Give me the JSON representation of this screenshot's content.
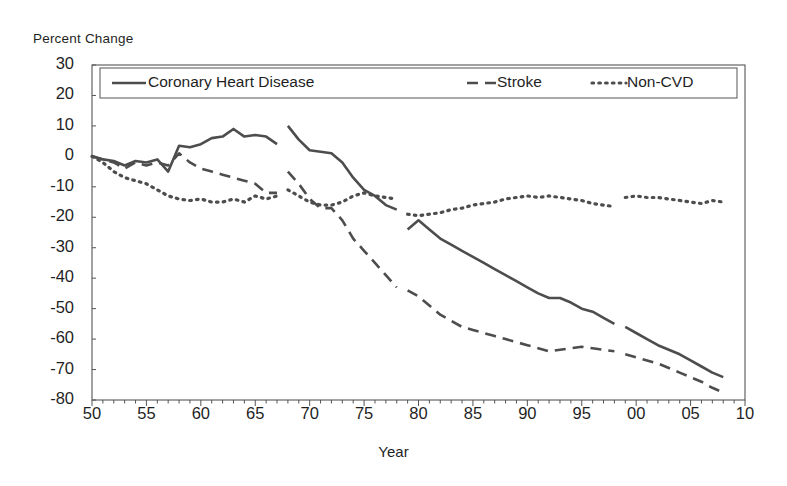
{
  "chart_data": {
    "type": "line",
    "title": "",
    "xlabel": "Year",
    "ylabel": "Percent Change",
    "ylim": [
      -80,
      30
    ],
    "xlim": [
      1950,
      2010
    ],
    "ytick_values": [
      30,
      20,
      10,
      0,
      -10,
      -20,
      -30,
      -40,
      -50,
      -60,
      -70,
      -80
    ],
    "ytick_labels": [
      "30",
      "20",
      "10",
      "0",
      "-10",
      "-20",
      "-30",
      "-40",
      "-50",
      "-60",
      "-70",
      "-80"
    ],
    "xtick_values": [
      1950,
      1955,
      1960,
      1965,
      1970,
      1975,
      1980,
      1985,
      1990,
      1995,
      2000,
      2005,
      2010
    ],
    "xtick_labels": [
      "50",
      "55",
      "60",
      "65",
      "70",
      "75",
      "80",
      "85",
      "90",
      "95",
      "00",
      "05",
      "10"
    ],
    "grid": false,
    "minor_ticks": "annual",
    "legend_position": "top-inside",
    "axis_color": "#555555",
    "series": [
      {
        "name": "Coronary Heart Disease",
        "style": "solid",
        "color": "#4d4d4d",
        "segments": [
          {
            "x": [
              1950,
              1951,
              1952,
              1953,
              1954,
              1955,
              1956,
              1957,
              1958,
              1959,
              1960,
              1961,
              1962,
              1963,
              1964,
              1965,
              1966,
              1967
            ],
            "y": [
              0,
              -1,
              -1.5,
              -3,
              -1.5,
              -2,
              -1,
              -5,
              3.5,
              3,
              4,
              6,
              6.5,
              9,
              6.5,
              7,
              6.5,
              4
            ]
          },
          {
            "x": [
              1968,
              1969,
              1970,
              1971,
              1972,
              1973,
              1974,
              1975,
              1976,
              1977,
              1978
            ],
            "y": [
              10,
              5.5,
              2,
              1.5,
              1,
              -2,
              -7,
              -11,
              -13,
              -16,
              -17.5
            ]
          },
          {
            "x": [
              1979,
              1980,
              1981,
              1982,
              1983,
              1984,
              1985,
              1986,
              1987,
              1988,
              1989,
              1990,
              1991,
              1992,
              1993,
              1994,
              1995,
              1996,
              1997,
              1998
            ],
            "y": [
              -24,
              -21,
              -24,
              -27,
              -29,
              -31,
              -33,
              -35,
              -37,
              -39,
              -41,
              -43,
              -45,
              -46.5,
              -46.5,
              -48,
              -50,
              -51,
              -53,
              -55
            ]
          },
          {
            "x": [
              1999,
              2000,
              2001,
              2002,
              2003,
              2004,
              2005,
              2006,
              2007,
              2008
            ],
            "y": [
              -56,
              -58,
              -60,
              -62,
              -63.5,
              -65,
              -67,
              -69,
              -71,
              -72.5
            ]
          }
        ]
      },
      {
        "name": "Stroke",
        "style": "dashed",
        "color": "#4d4d4d",
        "segments": [
          {
            "x": [
              1950,
              1951,
              1952,
              1953,
              1954,
              1955,
              1956,
              1957,
              1958,
              1959,
              1960,
              1961,
              1962,
              1963,
              1964,
              1965,
              1966,
              1967
            ],
            "y": [
              0,
              -1,
              -2,
              -4,
              -2,
              -3,
              -2,
              -3,
              1,
              -2,
              -4,
              -5,
              -6,
              -7,
              -8,
              -9,
              -12,
              -12
            ]
          },
          {
            "x": [
              1968,
              1969,
              1970,
              1971,
              1972,
              1973,
              1974,
              1975,
              1976,
              1977,
              1978
            ],
            "y": [
              -5,
              -9,
              -14,
              -17,
              -17,
              -21,
              -27,
              -31,
              -35,
              -39,
              -43
            ]
          },
          {
            "x": [
              1979,
              1980,
              1981,
              1982,
              1983,
              1984,
              1985,
              1986,
              1987,
              1988,
              1989,
              1990,
              1991,
              1992,
              1993,
              1994,
              1995,
              1996,
              1997,
              1998
            ],
            "y": [
              -44,
              -46,
              -49,
              -52,
              -54,
              -56,
              -57,
              -58,
              -59,
              -60,
              -61,
              -62,
              -63,
              -64,
              -63.5,
              -63,
              -62.5,
              -63,
              -63.5,
              -64
            ]
          },
          {
            "x": [
              1999,
              2000,
              2001,
              2002,
              2003,
              2004,
              2005,
              2006,
              2007,
              2008
            ],
            "y": [
              -65,
              -66,
              -67,
              -68,
              -69.5,
              -71,
              -72.5,
              -74,
              -76,
              -77.5
            ]
          }
        ]
      },
      {
        "name": "Non-CVD",
        "style": "dotted",
        "color": "#4d4d4d",
        "segments": [
          {
            "x": [
              1950,
              1951,
              1952,
              1953,
              1954,
              1955,
              1956,
              1957,
              1958,
              1959,
              1960,
              1961,
              1962,
              1963,
              1964,
              1965,
              1966,
              1967
            ],
            "y": [
              0,
              -2,
              -5,
              -7,
              -8,
              -9,
              -11,
              -13,
              -14,
              -14.5,
              -14,
              -15,
              -15,
              -14,
              -15,
              -13,
              -14,
              -13
            ]
          },
          {
            "x": [
              1968,
              1969,
              1970,
              1971,
              1972,
              1973,
              1974,
              1975,
              1976,
              1977,
              1978
            ],
            "y": [
              -11,
              -13,
              -15,
              -16,
              -16,
              -15,
              -13,
              -12,
              -13,
              -13.5,
              -14
            ]
          },
          {
            "x": [
              1979,
              1980,
              1981,
              1982,
              1983,
              1984,
              1985,
              1986,
              1987,
              1988,
              1989,
              1990,
              1991,
              1992,
              1993,
              1994,
              1995,
              1996,
              1997,
              1998
            ],
            "y": [
              -19,
              -19.5,
              -19,
              -18.5,
              -17.5,
              -17,
              -16,
              -15.5,
              -15,
              -14,
              -13.5,
              -13,
              -13.5,
              -13,
              -13.5,
              -14,
              -14.5,
              -15.5,
              -16,
              -16.5
            ]
          },
          {
            "x": [
              1999,
              2000,
              2001,
              2002,
              2003,
              2004,
              2005,
              2006,
              2007,
              2008
            ],
            "y": [
              -13.5,
              -13,
              -13.5,
              -13.5,
              -14,
              -14.5,
              -15,
              -15.5,
              -14.5,
              -15
            ]
          }
        ]
      }
    ]
  },
  "legend": {
    "items": [
      {
        "label": "Coronary Heart Disease",
        "style": "solid"
      },
      {
        "label": "Stroke",
        "style": "dashed"
      },
      {
        "label": "Non-CVD",
        "style": "dotted"
      }
    ]
  }
}
